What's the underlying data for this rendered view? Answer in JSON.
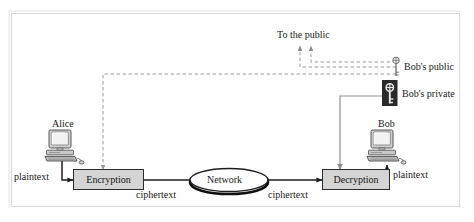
{
  "figure": {
    "background_color": "#fefefe",
    "frame_color": "#d8d8d8"
  },
  "labels": {
    "to_the_public": "To the public",
    "bobs_public": "Bob's public",
    "bobs_private": "Bob's private",
    "alice": "Alice",
    "bob": "Bob",
    "plaintext_left": "plaintext",
    "plaintext_right": "plaintext",
    "ciphertext_left": "ciphertext",
    "ciphertext_right": "ciphertext",
    "encryption": "Encryption",
    "decryption": "Decryption",
    "network": "Network"
  },
  "icons": {
    "alice_computer": "desktop-computer-icon",
    "bob_computer": "desktop-computer-icon",
    "public_key": "key-outline-icon",
    "private_key": "key-filled-dark-icon"
  },
  "colors": {
    "process_box_fill": "#d4d4d4",
    "process_box_stroke": "#2b2b2b",
    "dashed_line": "#9a9a9a",
    "solid_line": "#8f8f8f",
    "heavy_line": "#1d1d1d",
    "private_key_bg": "#2a2a2a",
    "text": "#1a1a1a"
  },
  "flows": [
    {
      "name": "alice-to-encryption",
      "label": "plaintext",
      "style": "solid"
    },
    {
      "name": "encryption-to-network",
      "label": "ciphertext",
      "style": "solid"
    },
    {
      "name": "network-to-decryption",
      "label": "ciphertext",
      "style": "solid"
    },
    {
      "name": "decryption-to-bob",
      "label": "plaintext",
      "style": "solid"
    },
    {
      "name": "public-key-to-encryption",
      "label": "Bob's public",
      "style": "dashed"
    },
    {
      "name": "public-key-to-the-public",
      "label": "To the public",
      "style": "dashed"
    },
    {
      "name": "private-key-to-decryption",
      "label": "Bob's private",
      "style": "solid"
    }
  ]
}
